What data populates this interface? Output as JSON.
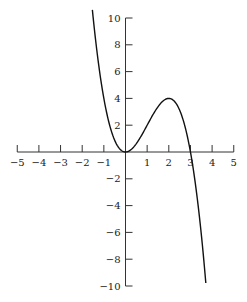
{
  "chart_data": {
    "type": "line",
    "title": "",
    "xlabel": "",
    "ylabel": "",
    "function": "y = 3x^2 - x^3",
    "xlim": [
      -5,
      5
    ],
    "ylim": [
      -10,
      10
    ],
    "x_ticks": [
      -5,
      -4,
      -3,
      -2,
      -1,
      1,
      2,
      3,
      4,
      5
    ],
    "y_ticks": [
      -10,
      -8,
      -6,
      -4,
      -2,
      2,
      4,
      6,
      8,
      10
    ],
    "x_tick_labels": [
      "−5",
      "−4",
      "−3",
      "−2",
      "−1",
      "1",
      "2",
      "3",
      "4",
      "5"
    ],
    "y_tick_labels": [
      "−10",
      "−8",
      "−6",
      "−4",
      "−2",
      "2",
      "4",
      "6",
      "8",
      "10"
    ],
    "grid": false,
    "legend": null,
    "series": [
      {
        "name": "curve",
        "x": [
          -1.53,
          -1.0,
          -0.5,
          0,
          0.5,
          1.0,
          1.5,
          2.0,
          2.5,
          3.0,
          3.5,
          3.71
        ],
        "values": [
          10.6,
          4.0,
          0.875,
          0,
          0.625,
          2.0,
          3.375,
          4.0,
          3.125,
          0,
          -6.125,
          -9.8
        ]
      }
    ],
    "annotations": [
      "local min (0,0)",
      "local max (2,4)"
    ]
  },
  "style": {
    "axis_color": "#333333",
    "curve_color": "#111111"
  }
}
